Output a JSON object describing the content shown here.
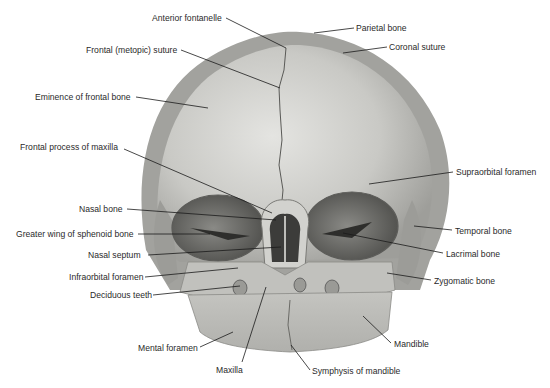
{
  "figure": {
    "colors": {
      "background": "#ffffff",
      "bone_light": "#d9d9d6",
      "bone_mid": "#b8b8b4",
      "bone_dark": "#8c8c88",
      "rim": "#9a9a96",
      "orbit": "#6e6e6a",
      "leader_line": "#1a1a1a",
      "label_text": "#2a2a2a"
    },
    "labels": [
      {
        "text": "Anterior fontanelle",
        "x": 152,
        "y": 13,
        "align": "left",
        "tx": 286,
        "ty": 48,
        "lx": 226,
        "ly": 18
      },
      {
        "text": "Frontal (metopic) suture",
        "x": 86,
        "y": 45,
        "align": "left",
        "tx": 280,
        "ty": 88,
        "lx": 181,
        "ly": 50
      },
      {
        "text": "Eminence of frontal bone",
        "x": 35,
        "y": 92,
        "align": "left",
        "tx": 208,
        "ty": 108,
        "lx": 136,
        "ly": 97
      },
      {
        "text": "Parietal bone",
        "x": 356,
        "y": 23,
        "align": "left",
        "tx": 314,
        "ty": 33,
        "lx": 354,
        "ly": 28
      },
      {
        "text": "Coronal suture",
        "x": 389,
        "y": 42,
        "align": "left",
        "tx": 343,
        "ty": 53,
        "lx": 387,
        "ly": 47
      },
      {
        "text": "Frontal process of maxilla",
        "x": 20,
        "y": 142,
        "align": "left",
        "tx": 272,
        "ty": 213,
        "lx": 124,
        "ly": 149
      },
      {
        "text": "Supraorbital foramen",
        "x": 456,
        "y": 167,
        "align": "left",
        "tx": 369,
        "ty": 184,
        "lx": 453,
        "ly": 172
      },
      {
        "text": "Nasal bone",
        "x": 79,
        "y": 204,
        "align": "left",
        "tx": 276,
        "ty": 220,
        "lx": 127,
        "ly": 209
      },
      {
        "text": "Greater wing of sphenoid bone",
        "x": 16,
        "y": 229,
        "align": "left",
        "tx": 210,
        "ty": 234,
        "lx": 138,
        "ly": 234
      },
      {
        "text": "Temporal bone",
        "x": 455,
        "y": 226,
        "align": "left",
        "tx": 414,
        "ty": 226,
        "lx": 452,
        "ly": 230
      },
      {
        "text": "Nasal septum",
        "x": 88,
        "y": 250,
        "align": "left",
        "tx": 281,
        "ty": 247,
        "lx": 148,
        "ly": 255
      },
      {
        "text": "Lacrimal bone",
        "x": 446,
        "y": 249,
        "align": "left",
        "tx": 343,
        "ty": 233,
        "lx": 443,
        "ly": 253
      },
      {
        "text": "Infraorbital foramen",
        "x": 69,
        "y": 272,
        "align": "left",
        "tx": 238,
        "ty": 268,
        "lx": 145,
        "ly": 277
      },
      {
        "text": "Zygomatic bone",
        "x": 434,
        "y": 276,
        "align": "left",
        "tx": 387,
        "ty": 273,
        "lx": 431,
        "ly": 280
      },
      {
        "text": "Deciduous teeth",
        "x": 90,
        "y": 290,
        "align": "left",
        "tx": 240,
        "ty": 286,
        "lx": 153,
        "ly": 295
      },
      {
        "text": "Mandible",
        "x": 394,
        "y": 339,
        "align": "left",
        "tx": 363,
        "ty": 316,
        "lx": 391,
        "ly": 343
      },
      {
        "text": "Mental foramen",
        "x": 138,
        "y": 343,
        "align": "left",
        "tx": 233,
        "ty": 332,
        "lx": 200,
        "ly": 347
      },
      {
        "text": "Maxilla",
        "x": 216,
        "y": 365,
        "align": "left",
        "tx": 266,
        "ty": 287,
        "lx": 242,
        "ly": 362
      },
      {
        "text": "Symphysis of mandible",
        "x": 312,
        "y": 366,
        "align": "left",
        "tx": 291,
        "ty": 345,
        "lx": 310,
        "ly": 370
      }
    ]
  }
}
